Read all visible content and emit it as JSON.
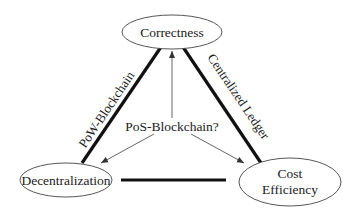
{
  "diagram": {
    "type": "triangle-tradeoff",
    "nodes": [
      {
        "id": "correctness",
        "lines": [
          "Correctness"
        ]
      },
      {
        "id": "decentralization",
        "lines": [
          "Decentralization"
        ]
      },
      {
        "id": "cost-efficiency",
        "lines": [
          "Cost",
          "Efficiency"
        ]
      }
    ],
    "edges": [
      {
        "from": "correctness",
        "to": "decentralization",
        "label": "PoW-Blockchain",
        "style": "thick"
      },
      {
        "from": "correctness",
        "to": "cost-efficiency",
        "label": "Centralized Ledger",
        "style": "thick"
      },
      {
        "from": "decentralization",
        "to": "cost-efficiency",
        "label": "",
        "style": "thick"
      }
    ],
    "center": {
      "label": "PoS-Blockchain?",
      "arrows_to": [
        "correctness",
        "decentralization",
        "cost-efficiency"
      ]
    },
    "colors": {
      "thick_line": "#111111",
      "thin_line": "#555555",
      "ellipse_stroke": "#444444",
      "text": "#1a1a1a",
      "background": "#ffffff"
    }
  }
}
